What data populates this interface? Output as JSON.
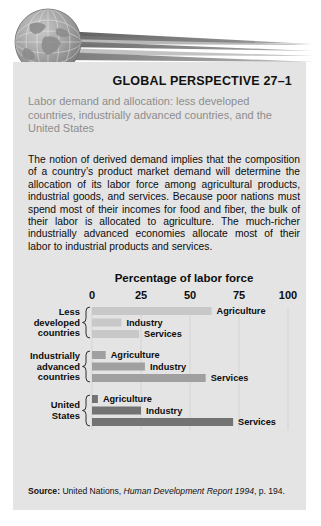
{
  "header": {
    "graphic_name": "globe-with-speed-streaks",
    "globe_color": "#9a9a9a",
    "streak_color": "#6e6e6e"
  },
  "panel": {
    "background": "#e4e4e4",
    "title": "GLOBAL PERSPECTIVE 27–1",
    "subtitle": "Labor demand and allocation: less developed countries, industrially advanced countries, and the United States",
    "subtitle_color": "#8d8d8d",
    "body": "The notion of derived demand implies that the composition of a country’s product market demand will determine the allocation of its labor force among agricultural products, industrial goods, and services. Because poor nations must spend most of their incomes for food and fiber, the bulk of their labor is allocated to agriculture. The much-richer industrially advanced economies allocate most of their labor to industrial products and services."
  },
  "source": {
    "prefix": "Source:",
    "text_before_italic": " United Nations, ",
    "italic": "Human Development Report 1994",
    "text_after_italic": ", p. 194."
  },
  "chart_data": {
    "type": "bar",
    "orientation": "horizontal",
    "title": "Percentage of labor force",
    "xlabel": "Percentage of labor force",
    "ylabel": "",
    "xlim": [
      0,
      100
    ],
    "ticks": [
      0,
      25,
      50,
      75,
      100
    ],
    "tick_labels": [
      "0",
      "25",
      "50",
      "75",
      "100"
    ],
    "grid": true,
    "legend": "none",
    "groups": [
      {
        "name": "Less developed countries",
        "label_lines": [
          "Less",
          "developed",
          "countries"
        ],
        "color": "#c8c8c8",
        "categories": [
          "Agriculture",
          "Industry",
          "Services"
        ],
        "values": [
          61,
          15,
          24
        ]
      },
      {
        "name": "Industrially advanced countries",
        "label_lines": [
          "Industrially",
          "advanced",
          "countries"
        ],
        "color": "#a0a0a0",
        "categories": [
          "Agriculture",
          "Industry",
          "Services"
        ],
        "values": [
          7,
          27,
          58
        ]
      },
      {
        "name": "United States",
        "label_lines": [
          "United",
          "States"
        ],
        "color": "#737373",
        "categories": [
          "Agriculture",
          "Industry",
          "Services"
        ],
        "values": [
          3,
          25,
          72
        ]
      }
    ]
  }
}
